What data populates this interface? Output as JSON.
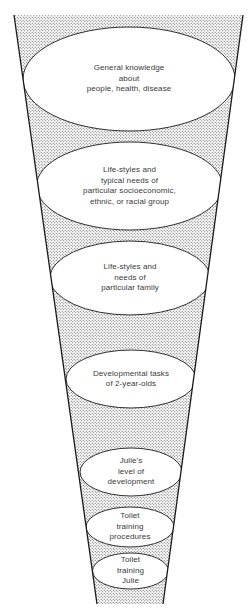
{
  "diagram": {
    "type": "inverted-funnel",
    "fill_pattern": "stippled-dots",
    "colors": {
      "outline": "#1a1a1a",
      "dots": "#555555",
      "ellipse_fill": "#ffffff",
      "text": "#3a3a3a"
    },
    "levels": [
      {
        "id": "general-knowledge",
        "lines": [
          "General knowledge",
          "about",
          "people, health, disease"
        ]
      },
      {
        "id": "group-lifestyles",
        "lines": [
          "Life-styles and",
          "typical needs of",
          "particular socioeconomic,",
          "ethnic, or racial group"
        ]
      },
      {
        "id": "family-lifestyles",
        "lines": [
          "Life-styles and",
          "needs of",
          "particular family"
        ]
      },
      {
        "id": "developmental-tasks",
        "lines": [
          "Developmental tasks",
          "of 2-year-olds"
        ]
      },
      {
        "id": "julies-development",
        "lines": [
          "Julie's",
          "level of",
          "development"
        ]
      },
      {
        "id": "toilet-procedures",
        "lines": [
          "Toilet",
          "training",
          "procedures"
        ]
      },
      {
        "id": "toilet-training-julie",
        "lines": [
          "Toilet",
          "training",
          "Julie"
        ]
      }
    ],
    "caption_truncated": true
  }
}
